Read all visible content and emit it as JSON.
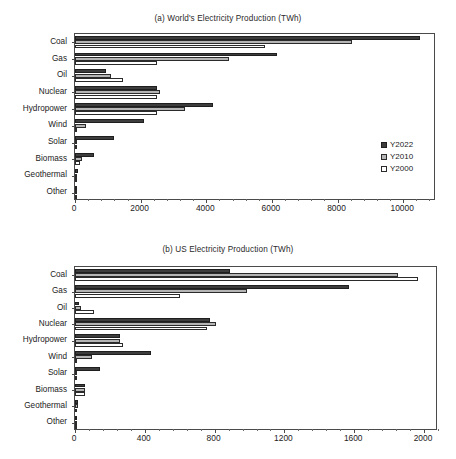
{
  "figure": {
    "panels": [
      "(a) World's Electricity Production (TWh)",
      "(b) US Electricity Production (TWh)"
    ]
  },
  "legend": {
    "items": [
      {
        "label": "Y2022",
        "color": "#3d3d3d",
        "key": "y2022"
      },
      {
        "label": "Y2010",
        "color": "#b5b5b5",
        "key": "y2010"
      },
      {
        "label": "Y2000",
        "color": "#ffffff",
        "key": "y2000"
      }
    ]
  },
  "chart_data": [
    {
      "type": "bar",
      "orientation": "horizontal",
      "title": "(a) World's Electricity Production (TWh)",
      "xlabel": "",
      "ylabel": "",
      "xlim": [
        0,
        11000
      ],
      "xticks": [
        0,
        2000,
        4000,
        6000,
        8000,
        10000
      ],
      "xticklabels": [
        "0",
        "2000",
        "4000",
        "6000",
        "8000",
        "10000"
      ],
      "grid": false,
      "legend_position": "right-middle",
      "categories": [
        "Coal",
        "Gas",
        "Oil",
        "Nuclear",
        "Hydropower",
        "Wind",
        "Solar",
        "Biomass",
        "Geothermal",
        "Other"
      ],
      "series": [
        {
          "name": "Y2022",
          "color": "#3d3d3d",
          "values": [
            10500,
            6150,
            950,
            2500,
            4200,
            2100,
            1200,
            570,
            90,
            60
          ]
        },
        {
          "name": "Y2010",
          "color": "#b5b5b5",
          "values": [
            8450,
            4700,
            1100,
            2600,
            3350,
            350,
            30,
            200,
            65,
            40
          ]
        },
        {
          "name": "Y2000",
          "color": "#ffffff",
          "values": [
            5800,
            2500,
            1450,
            2500,
            2500,
            30,
            1,
            140,
            50,
            30
          ]
        }
      ]
    },
    {
      "type": "bar",
      "orientation": "horizontal",
      "title": "(b) US Electricity Production (TWh)",
      "xlabel": "",
      "ylabel": "",
      "xlim": [
        0,
        2080
      ],
      "xticks": [
        0,
        400,
        800,
        1200,
        1600,
        2000
      ],
      "xticklabels": [
        "0",
        "400",
        "800",
        "1200",
        "1600",
        "2000"
      ],
      "grid": false,
      "legend_position": "right-middle",
      "categories": [
        "Coal",
        "Gas",
        "Oil",
        "Nuclear",
        "Hydropower",
        "Wind",
        "Solar",
        "Biomass",
        "Geothermal",
        "Other"
      ],
      "series": [
        {
          "name": "Y2022",
          "color": "#3d3d3d",
          "values": [
            890,
            1570,
            23,
            775,
            255,
            435,
            145,
            55,
            16,
            4
          ]
        },
        {
          "name": "Y2010",
          "color": "#b5b5b5",
          "values": [
            1850,
            988,
            37,
            807,
            260,
            95,
            1,
            56,
            17,
            3
          ]
        },
        {
          "name": "Y2000",
          "color": "#ffffff",
          "values": [
            1966,
            601,
            111,
            754,
            275,
            6,
            1,
            60,
            14,
            3
          ]
        }
      ]
    }
  ]
}
